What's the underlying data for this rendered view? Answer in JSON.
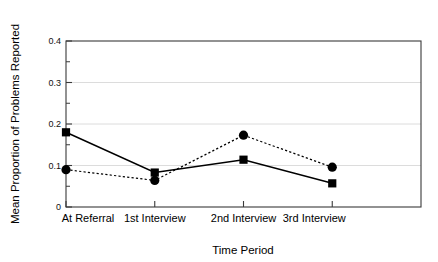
{
  "chart_data": {
    "type": "line",
    "title": "",
    "xlabel": "Time Period",
    "ylabel": "Mean Proportion of Problems Reported",
    "categories": [
      "At Referral",
      "1st Interview",
      "2nd Interview",
      "3rd Interview"
    ],
    "ylim": [
      0,
      0.4
    ],
    "ytick_labels": [
      "0",
      "0.1",
      "0.2",
      "0.3",
      "0.4"
    ],
    "ytick_values": [
      0,
      0.1,
      0.2,
      0.3,
      0.4
    ],
    "yminor_values": [
      0.05,
      0.15,
      0.25,
      0.35
    ],
    "grid": "horizontal-major-light",
    "legend": "none",
    "series": [
      {
        "name": "solid-square-series",
        "marker": "square",
        "line_style": "solid",
        "color": "#000000",
        "values": [
          0.18,
          0.083,
          0.114,
          0.057
        ]
      },
      {
        "name": "dashed-circle-series",
        "marker": "circle",
        "line_style": "dotted",
        "color": "#000000",
        "values": [
          0.09,
          0.064,
          0.173,
          0.096
        ]
      }
    ]
  },
  "colors": {
    "background": "#ffffff",
    "axis": "#3a3a3a",
    "grid": "#d8d8d8",
    "ink": "#000000"
  }
}
